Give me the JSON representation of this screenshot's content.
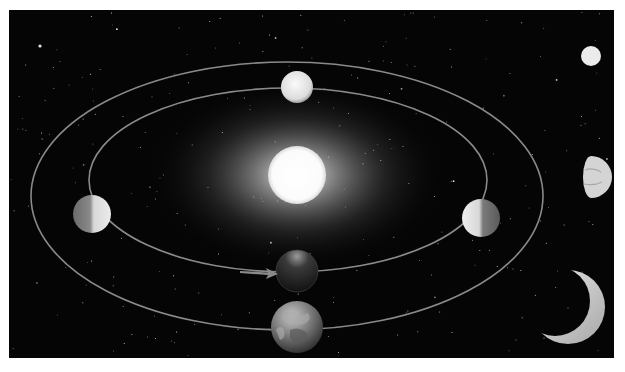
{
  "figure": {
    "description": "Phases of Venus as it orbits the Sun, viewed from Earth",
    "colors": {
      "page_background": "#ffffff",
      "space_background": "#050505",
      "orbit_line": "#8a8a8a",
      "sun_core": "#ffffff",
      "glow": "#d8d8d8",
      "venus_lit": "#e6e6e6",
      "venus_dark": "#1c1c1c",
      "earth": "#7a7a7a"
    },
    "frame": {
      "x": 9,
      "y": 10,
      "width": 605,
      "height": 348
    },
    "sun": {
      "cx": 297,
      "cy": 175,
      "r": 29,
      "glow_rx": 150,
      "glow_ry": 95
    },
    "orbits": {
      "earth_orbit": {
        "cx": 287,
        "cy": 196,
        "rx": 256,
        "ry": 134
      },
      "venus_orbit": {
        "cx": 288,
        "cy": 180,
        "rx": 199,
        "ry": 92
      }
    },
    "venus_positions": [
      {
        "name": "top",
        "phase": "full",
        "cx": 297,
        "cy": 87,
        "r": 16
      },
      {
        "name": "left",
        "phase": "half-lit-right",
        "cx": 92,
        "cy": 214,
        "r": 19
      },
      {
        "name": "right",
        "phase": "half-lit-left",
        "cx": 481,
        "cy": 218,
        "r": 19
      },
      {
        "name": "bottom",
        "phase": "new",
        "cx": 297,
        "cy": 271,
        "r": 21
      }
    ],
    "earth": {
      "cx": 297,
      "cy": 327,
      "r": 26
    },
    "arrow": {
      "x1": 240,
      "y1": 272,
      "x2": 278,
      "y2": 274,
      "direction": "right"
    },
    "phase_views": [
      {
        "name": "full-view",
        "phase": "full",
        "cx": 591,
        "cy": 56,
        "r": 10
      },
      {
        "name": "gibbous-view",
        "phase": "gibbous",
        "cx": 591,
        "cy": 177,
        "r": 21
      },
      {
        "name": "crescent-view",
        "phase": "crescent",
        "cx": 568,
        "cy": 307,
        "r": 37
      }
    ]
  }
}
